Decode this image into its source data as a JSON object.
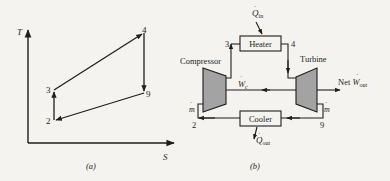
{
  "panel_a": {
    "caption": "(a)",
    "y_axis_label": "T",
    "x_axis_label": "S",
    "points": [
      {
        "id": "2",
        "label": "2"
      },
      {
        "id": "3",
        "label": "3"
      },
      {
        "id": "4",
        "label": "4"
      },
      {
        "id": "9",
        "label": "9"
      }
    ],
    "path_order": [
      "2",
      "3",
      "4",
      "9",
      "2"
    ]
  },
  "panel_b": {
    "caption": "(b)",
    "components": {
      "heater": "Heater",
      "cooler": "Cooler",
      "compressor": "Compressor",
      "turbine": "Turbine"
    },
    "state_labels": {
      "s2": "2",
      "s3": "3",
      "s4": "4",
      "s9": "9"
    },
    "flows": {
      "q_in": {
        "symbol": "Q",
        "sub": "in"
      },
      "q_out": {
        "symbol": "Q",
        "sub": "out"
      },
      "w_c": {
        "symbol": "W",
        "sub": "c"
      },
      "net_w_out": {
        "prefix": "Net",
        "symbol": "W",
        "sub": "out"
      },
      "m_dot_left": "m",
      "m_dot_right": "m"
    },
    "colors": {
      "machine_fill": "#a3a3a3",
      "line": "#1e1e1e"
    }
  }
}
